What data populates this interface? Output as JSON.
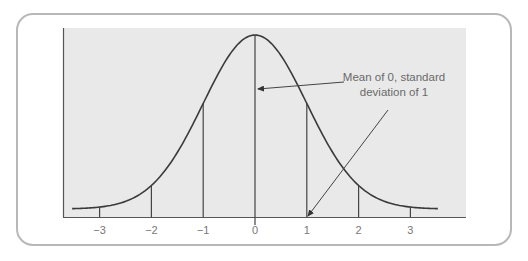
{
  "chart_data": {
    "type": "line",
    "title": "",
    "subtitle": "",
    "xlabel": "",
    "ylabel": "",
    "x_ticks": [
      -3,
      -2,
      -1,
      0,
      1,
      2,
      3
    ],
    "x_tick_labels": [
      "−3",
      "−2",
      "−1",
      "0",
      "1",
      "2",
      "3"
    ],
    "xlim": [
      -3.5,
      3.5
    ],
    "series": [
      {
        "name": "Normal distribution (mean 0, SD 1)",
        "x": [
          -3.5,
          -3,
          -2.5,
          -2,
          -1.5,
          -1,
          -0.5,
          0,
          0.5,
          1,
          1.5,
          2,
          2.5,
          3,
          3.5
        ],
        "y": [
          0.0009,
          0.0044,
          0.0175,
          0.054,
          0.1295,
          0.242,
          0.3521,
          0.3989,
          0.3521,
          0.242,
          0.1295,
          0.054,
          0.0175,
          0.0044,
          0.0009
        ]
      }
    ],
    "vertical_lines_at": [
      -3,
      -2,
      -1,
      0,
      1,
      2,
      3
    ],
    "annotations": [
      {
        "text_lines": [
          "Mean of 0, standard",
          "deviation of 1"
        ],
        "arrows_to": [
          {
            "target": "mean line (x=0)"
          },
          {
            "target": "x = 1 on axis"
          }
        ]
      }
    ],
    "grid": false,
    "legend": "none",
    "colors": {
      "plot_background": "#e9e9e9",
      "curve": "#3a3a3a",
      "axis": "#555555",
      "frame": "#b5b5b5",
      "text": "#777777"
    }
  },
  "annotation": {
    "line1": "Mean of 0, standard",
    "line2": "deviation of 1"
  },
  "ticks": [
    "−3",
    "−2",
    "−1",
    "0",
    "1",
    "2",
    "3"
  ]
}
